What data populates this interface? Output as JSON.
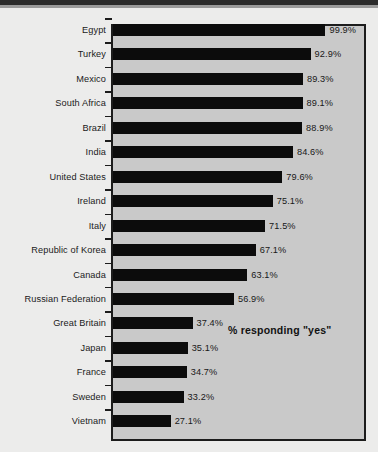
{
  "chart_data": {
    "type": "bar",
    "orientation": "horizontal",
    "title": "",
    "subtitle": "",
    "xlabel": "",
    "ylabel": "",
    "annotation": "% responding \"yes\"",
    "xlim": [
      0,
      118
    ],
    "grid": false,
    "legend": null,
    "value_suffix": "%",
    "categories": [
      "Egypt",
      "Turkey",
      "Mexico",
      "South Africa",
      "Brazil",
      "India",
      "United States",
      "Ireland",
      "Italy",
      "Republic of Korea",
      "Canada",
      "Russian Federation",
      "Great Britain",
      "Japan",
      "France",
      "Sweden",
      "Vietnam"
    ],
    "values": [
      99.9,
      92.9,
      89.3,
      89.1,
      88.9,
      84.6,
      79.6,
      75.1,
      71.5,
      67.1,
      63.1,
      56.9,
      37.4,
      35.1,
      34.7,
      33.2,
      27.1
    ],
    "value_labels": [
      "99.9%",
      "92.9%",
      "89.3%",
      "89.1%",
      "88.9%",
      "84.6%",
      "79.6%",
      "75.1%",
      "71.5%",
      "67.1%",
      "63.1%",
      "56.9%",
      "37.4%",
      "35.1%",
      "34.7%",
      "33.2%",
      "27.1%"
    ],
    "colors": {
      "bar": "#0c0c0c",
      "plot_background": "#c9c9c9",
      "page_background": "#ececeb",
      "frame": "#1c1c1c",
      "text": "#1a1a1a"
    }
  }
}
